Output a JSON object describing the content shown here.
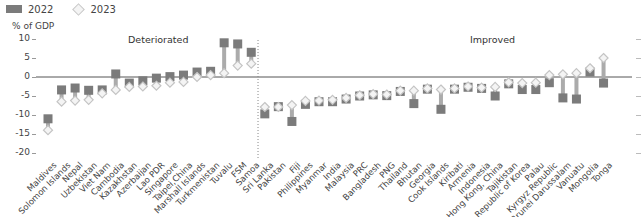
{
  "legend": {
    "series_2022": "2022",
    "series_2023": "2023"
  },
  "axis": {
    "unit_label": "% of GDP",
    "y_ticks": [
      "10",
      "5",
      "0",
      "-5",
      "-10",
      "-15",
      "-20"
    ]
  },
  "regions": {
    "left": "Deteriorated",
    "right": "Improved"
  },
  "colors": {
    "square_2022": "#7b7b7b",
    "diamond_2023_fill": "#f4f4f4",
    "diamond_2023_stroke": "#c4c4c4",
    "connector": "#ababab",
    "zero_line": "#555555",
    "divider": "#888888"
  },
  "chart_data": {
    "type": "dot-range",
    "title": "",
    "ylabel": "% of GDP",
    "xlabel": "",
    "ylim": [
      -20,
      10
    ],
    "y_ticks": [
      10,
      5,
      0,
      -5,
      -10,
      -15,
      -20
    ],
    "legend_position": "top-left",
    "grid": false,
    "groups": [
      {
        "name": "Deteriorated",
        "start_index": 0,
        "end_index": 16
      },
      {
        "name": "Improved",
        "start_index": 17,
        "end_index": 44
      }
    ],
    "categories": [
      "Maldives",
      "Solomon Islands",
      "Nepal",
      "Uzbekistan",
      "Viet Nam",
      "Cambodia",
      "Kazakhstan",
      "Azerbaijan",
      "Lao PDR",
      "Singapore",
      "Taipei,China",
      "Marshall Islands",
      "Turkmenistan",
      "Tuvalu",
      "FSM",
      "Samoa",
      "Sri Lanka",
      "Pakistan",
      "Fiji",
      "Philippines",
      "Myanmar",
      "India",
      "Malaysia",
      "PRC",
      "Bangladesh",
      "PNG",
      "Thailand",
      "Bhutan",
      "Georgia",
      "Cook Islands",
      "Kiribati",
      "Armenia",
      "Indonesia",
      "Hong Kong, China",
      "Tajikistan",
      "Republic of Korea",
      "Palau",
      "Kyrgyz Republic",
      "Brunei Darussalam",
      "Vanuatu",
      "Mongolia",
      "Tonga"
    ],
    "series": [
      {
        "name": "2022",
        "marker": "square",
        "values": [
          -11.0,
          -3.4,
          -2.9,
          -3.5,
          -3.4,
          0.8,
          -1.6,
          -1.0,
          -0.3,
          0.1,
          0.5,
          1.3,
          1.5,
          9.0,
          8.7,
          6.5,
          -9.7,
          -7.8,
          -11.7,
          -7.2,
          -6.5,
          -6.5,
          -5.8,
          -5.0,
          -4.7,
          -4.9,
          -3.8,
          -7.0,
          -3.2,
          -8.5,
          -3.2,
          -2.7,
          -3.0,
          -5.0,
          -1.8,
          -3.3,
          -3.3,
          -1.5,
          -5.5,
          -5.8,
          1.3,
          -1.6
        ]
      },
      {
        "name": "2023",
        "marker": "diamond",
        "values": [
          -14.0,
          -6.5,
          -6.2,
          -6.0,
          -4.3,
          -3.4,
          -2.6,
          -2.5,
          -2.3,
          -1.5,
          -1.3,
          0.0,
          0.5,
          1.0,
          3.0,
          3.5,
          -7.9,
          -7.9,
          -7.4,
          -6.3,
          -6.2,
          -6.0,
          -5.5,
          -4.8,
          -4.5,
          -4.6,
          -3.6,
          -3.6,
          -3.0,
          -3.3,
          -3.0,
          -2.5,
          -2.8,
          -2.6,
          -1.4,
          -1.6,
          -1.5,
          0.5,
          0.7,
          1.0,
          2.3,
          5.0
        ]
      }
    ]
  }
}
